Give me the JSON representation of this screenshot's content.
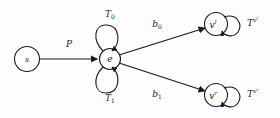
{
  "figure": {
    "type": "state-transition-diagram",
    "background_color": "#fdfdfd",
    "stroke_color": "#1a1a1a",
    "width": 280,
    "height": 118
  },
  "nodes": [
    {
      "id": "source",
      "label": "s",
      "superscript": "",
      "cx": 27,
      "cy": 59,
      "r": 12.5
    },
    {
      "id": "e",
      "label": "e",
      "superscript": "",
      "cx": 110,
      "cy": 59,
      "r": 10.5
    },
    {
      "id": "vl",
      "label": "v",
      "superscript": "l",
      "cx": 216,
      "cy": 24,
      "r": 11.5
    },
    {
      "id": "vr",
      "label": "v",
      "superscript": "r",
      "cx": 216,
      "cy": 95,
      "r": 11.5
    }
  ],
  "edges": [
    {
      "id": "p-edge",
      "label": "P",
      "subscript": "",
      "from": "source",
      "to": "e",
      "label_x": 69,
      "label_y": 47
    },
    {
      "id": "b0-edge",
      "label": "b",
      "subscript": "0",
      "from": "e",
      "to": "vl",
      "label_x": 157,
      "label_y": 27
    },
    {
      "id": "b1-edge",
      "label": "b",
      "subscript": "1",
      "from": "e",
      "to": "vr",
      "label_x": 157,
      "label_y": 97
    }
  ],
  "self_loops": [
    {
      "id": "loop-t0",
      "label": "T",
      "subscript": "0",
      "node": "e",
      "position": "above",
      "label_x": 110,
      "label_y": 17
    },
    {
      "id": "loop-t1",
      "label": "T",
      "subscript": "1",
      "node": "e",
      "position": "below",
      "label_x": 110,
      "label_y": 101
    },
    {
      "id": "loop-vl",
      "label": "",
      "subscript": "",
      "node": "vl",
      "position": "right",
      "label_x": 0,
      "label_y": 0
    },
    {
      "id": "loop-vr",
      "label": "",
      "subscript": "",
      "node": "vr",
      "position": "right",
      "label_x": 0,
      "label_y": 0
    }
  ],
  "tree_labels": [
    {
      "id": "tree-vl",
      "base": "T",
      "sup": "v",
      "sup2": "l",
      "x": 247,
      "y": 26
    },
    {
      "id": "tree-vr",
      "base": "T",
      "sup": "v",
      "sup2": "r",
      "x": 247,
      "y": 97
    }
  ]
}
